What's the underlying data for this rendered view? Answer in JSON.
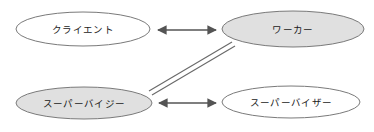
{
  "diagram": {
    "title": "",
    "background_color": "#ffffff",
    "nodes": [
      {
        "id": "client",
        "label": "クライエント",
        "fill": "#ffffff",
        "stroke": "#7a7a7a",
        "cx": 83,
        "cy": 29,
        "rx": 67,
        "ry": 17,
        "position": "top-left"
      },
      {
        "id": "worker",
        "label": "ワーカー",
        "fill": "#e0e0e0",
        "stroke": "#7a7a7a",
        "cx": 293,
        "cy": 29,
        "rx": 71,
        "ry": 18,
        "position": "top-right"
      },
      {
        "id": "supervisee",
        "label": "スーパーバイジー",
        "fill": "#e0e0e0",
        "stroke": "#7a7a7a",
        "cx": 84,
        "cy": 103,
        "rx": 68,
        "ry": 16,
        "position": "bottom-left"
      },
      {
        "id": "supervisor",
        "label": "スーパーバイザー",
        "fill": "#ffffff",
        "stroke": "#7a7a7a",
        "cx": 291,
        "cy": 102,
        "rx": 69,
        "ry": 16,
        "position": "bottom-right"
      }
    ],
    "connectors": [
      {
        "id": "client-worker",
        "from": "client",
        "to": "worker",
        "style": "double-headed-arrow",
        "color": "#545454",
        "x1": 152,
        "y1": 30,
        "x2": 221,
        "y2": 30
      },
      {
        "id": "supervisee-supervisor",
        "from": "supervisee",
        "to": "supervisor",
        "style": "double-headed-arrow",
        "color": "#545454",
        "x1": 153,
        "y1": 103,
        "x2": 221,
        "y2": 103
      },
      {
        "id": "supervisee-worker",
        "from": "supervisee",
        "to": "worker",
        "style": "double-parallel-line",
        "color": "#6a6a6a",
        "x1": 150,
        "y1": 93,
        "x2": 233,
        "y2": 44
      }
    ]
  }
}
